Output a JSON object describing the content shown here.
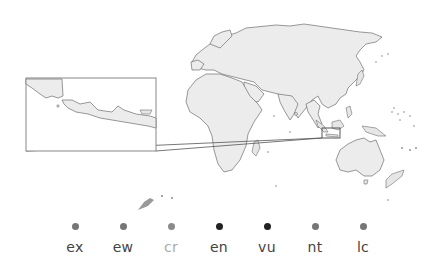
{
  "map": {
    "title": "",
    "inset_region": "Java (Indonesia)",
    "colors": {
      "land": "#ececec",
      "outline": "#6e6e6e",
      "frame": "#7a7a7a"
    }
  },
  "legend": {
    "items": [
      {
        "code": "ex",
        "dot_color": "#777777",
        "text_color": "#444444",
        "x": 75
      },
      {
        "code": "ew",
        "dot_color": "#777777",
        "text_color": "#444444",
        "x": 123
      },
      {
        "code": "cr",
        "dot_color": "#8a8a8a",
        "text_color": "#aaaaaa",
        "x": 171
      },
      {
        "code": "en",
        "dot_color": "#222222",
        "text_color": "#444444",
        "x": 219
      },
      {
        "code": "vu",
        "dot_color": "#222222",
        "text_color": "#444444",
        "x": 267
      },
      {
        "code": "nt",
        "dot_color": "#777777",
        "text_color": "#444444",
        "x": 315
      },
      {
        "code": "lc",
        "dot_color": "#777777",
        "text_color": "#444444",
        "x": 363
      }
    ]
  }
}
